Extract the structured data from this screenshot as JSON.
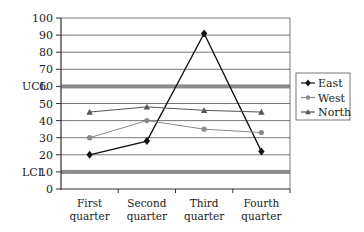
{
  "chart_data": {
    "type": "line",
    "title": "",
    "xlabel": "",
    "ylabel": "",
    "categories": [
      "First quarter",
      "Second quarter",
      "Third quarter",
      "Fourth quarter"
    ],
    "category_lines": [
      [
        "First",
        "quarter"
      ],
      [
        "Second",
        "quarter"
      ],
      [
        "Third",
        "quarter"
      ],
      [
        "Fourth",
        "quarter"
      ]
    ],
    "series": [
      {
        "name": "East",
        "values": [
          20,
          28,
          91,
          22
        ],
        "color": "#111111",
        "marker": "diamond"
      },
      {
        "name": "West",
        "values": [
          30,
          40,
          35,
          33
        ],
        "color": "#8a8a8a",
        "marker": "circle"
      },
      {
        "name": "North",
        "values": [
          45,
          48,
          46,
          45
        ],
        "color": "#555555",
        "marker": "triangle"
      }
    ],
    "ylim": [
      0,
      100
    ],
    "yticks": [
      0,
      10,
      20,
      30,
      40,
      50,
      60,
      70,
      80,
      90,
      100
    ],
    "grid": true,
    "control_limits": [
      {
        "label": "UCL",
        "value": 60,
        "color": "#8c8c8c"
      },
      {
        "label": "LCL",
        "value": 10,
        "color": "#8c8c8c"
      }
    ],
    "legend_position": "right"
  }
}
